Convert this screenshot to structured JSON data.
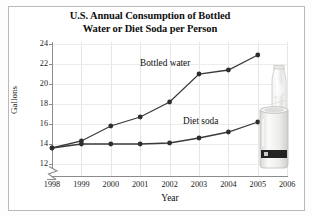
{
  "figure": {
    "title_line1": "U.S. Annual Consumption of Bottled",
    "title_line2": "Water or Diet Soda per Person"
  },
  "photo": {
    "bottle_alt": "water-bottle-photo",
    "can_alt": "soda-can-photo"
  },
  "chart_data": {
    "type": "line",
    "title": "U.S. Annual Consumption of Bottled Water or Diet Soda per Person",
    "xlabel": "Year",
    "ylabel": "Gallons",
    "x": [
      1998,
      1999,
      2000,
      2001,
      2002,
      2003,
      2004,
      2005
    ],
    "xtick_labels": [
      "1998",
      "1999",
      "2000",
      "2001",
      "2002",
      "2003",
      "2004",
      "2005",
      "2006"
    ],
    "xlim": [
      1998,
      2006
    ],
    "ytick_labels": [
      "12",
      "14",
      "16",
      "18",
      "20",
      "22",
      "24"
    ],
    "ylim": [
      12,
      24
    ],
    "y_axis_break": true,
    "grid": true,
    "legend": "inline-labels",
    "series": [
      {
        "name": "Bottled water",
        "label_x": 2002,
        "values": [
          13.6,
          14.3,
          15.8,
          16.7,
          18.2,
          21.0,
          21.4,
          22.9
        ]
      },
      {
        "name": "Diet soda",
        "label_x": 2003,
        "values": [
          13.6,
          14.0,
          14.0,
          14.0,
          14.1,
          14.6,
          15.2,
          16.2
        ]
      }
    ]
  }
}
